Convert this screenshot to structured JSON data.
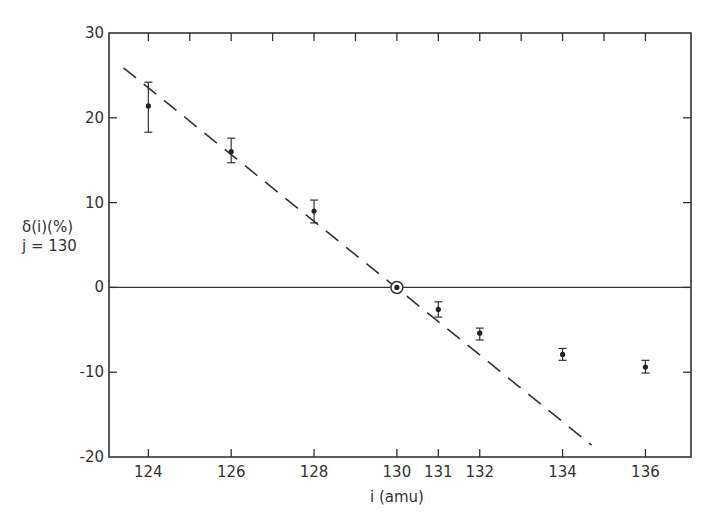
{
  "chart_data": {
    "type": "scatter",
    "title": "",
    "xlabel": "i (amu)",
    "ylabel": [
      "δ(i)(%)",
      "j = 130"
    ],
    "xlim": [
      123.05,
      137.1
    ],
    "ylim": [
      -20,
      30
    ],
    "grid": false,
    "legend": null,
    "x_ticks_labeled": [
      124,
      126,
      128,
      130,
      131,
      132,
      134,
      136
    ],
    "x_ticks_top_minor": [
      124,
      125,
      126,
      127,
      128,
      129,
      130,
      131,
      132,
      133,
      134,
      135,
      136
    ],
    "y_ticks": [
      30,
      20,
      10,
      0,
      -10,
      -20
    ],
    "zero_line": true,
    "series": [
      {
        "name": "measured δ(i)",
        "marker": "dot-with-errorbar",
        "points": [
          {
            "x": 124,
            "y": 21.4,
            "err_low": 18.3,
            "err_high": 24.2
          },
          {
            "x": 126,
            "y": 16.0,
            "err_low": 14.7,
            "err_high": 17.6
          },
          {
            "x": 128,
            "y": 9.0,
            "err_low": 7.6,
            "err_high": 10.3
          },
          {
            "x": 130,
            "y": 0.0,
            "reference": true
          },
          {
            "x": 131,
            "y": -2.6,
            "err_low": -3.5,
            "err_high": -1.7
          },
          {
            "x": 132,
            "y": -5.4,
            "err_low": -6.2,
            "err_high": -4.8
          },
          {
            "x": 134,
            "y": -7.9,
            "err_low": -8.6,
            "err_high": -7.2
          },
          {
            "x": 136,
            "y": -9.4,
            "err_low": -10.1,
            "err_high": -8.6
          }
        ]
      },
      {
        "name": "linear fit",
        "style": "dashed",
        "points": [
          {
            "x": 123.4,
            "y": 25.9
          },
          {
            "x": 134.7,
            "y": -18.6
          }
        ]
      }
    ]
  },
  "labels": {
    "ylabel_line1": "δ(i)(%)",
    "ylabel_line2": "j = 130",
    "xlabel": "i (amu)"
  }
}
